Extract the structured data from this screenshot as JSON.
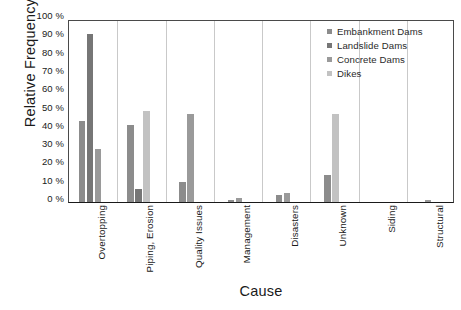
{
  "chart_data": {
    "type": "bar",
    "title": "",
    "xlabel": "Cause",
    "ylabel": "Relative Frequency",
    "ylim": [
      0,
      100
    ],
    "ytick_labels": [
      "0 %",
      "10 %",
      "20 %",
      "30 %",
      "40 %",
      "50 %",
      "60 %",
      "70 %",
      "80 %",
      "90 %",
      "100 %"
    ],
    "ytick_values": [
      0,
      10,
      20,
      30,
      40,
      50,
      60,
      70,
      80,
      90,
      100
    ],
    "grid": false,
    "legend_position": "upper right",
    "categories": [
      "Overtopping",
      "Piping, Erosion",
      "Quality Issues",
      "Management",
      "Disasters",
      "Unknown",
      "Siding",
      "Structural"
    ],
    "series": [
      {
        "name": "Embankment Dams",
        "color": "#8c8c8c",
        "values": [
          44,
          42,
          11,
          1,
          4,
          15,
          0,
          0
        ]
      },
      {
        "name": "Landslide Dams",
        "color": "#767676",
        "values": [
          92,
          7,
          0,
          0,
          0,
          0,
          0,
          0
        ]
      },
      {
        "name": "Concrete Dams",
        "color": "#9a9a9a",
        "values": [
          29,
          0,
          48,
          2,
          5,
          0,
          0,
          1
        ]
      },
      {
        "name": "Dikes",
        "color": "#c2c2c2",
        "values": [
          0,
          50,
          0,
          0,
          0,
          48,
          0,
          0
        ]
      }
    ]
  }
}
